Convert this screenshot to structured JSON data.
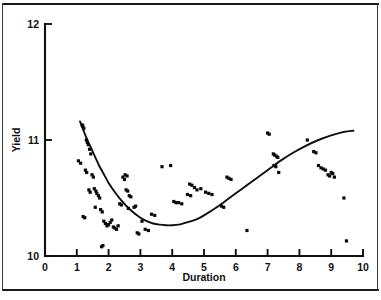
{
  "figure": {
    "background_color": "#ffffff",
    "ink_color": "#0d0d0d",
    "frame": {
      "top_rule": true,
      "bottom_rule": true,
      "left_rule": true,
      "right_rule": true
    }
  },
  "chart_data": {
    "type": "scatter",
    "title": "",
    "xlabel": "Duration",
    "ylabel": "Yield",
    "xlim": [
      0,
      10
    ],
    "ylim": [
      10,
      12
    ],
    "xticks": [
      0,
      1,
      2,
      3,
      4,
      5,
      6,
      7,
      8,
      9,
      10
    ],
    "xticklabels": [
      "0",
      "1",
      "2",
      "3",
      "4",
      "5",
      "6",
      "7",
      "8",
      "9",
      "10"
    ],
    "yticks": [
      10,
      11,
      12
    ],
    "yticklabels": [
      "10",
      "11",
      "12"
    ],
    "grid": false,
    "legend": null,
    "marker": "square",
    "marker_color": "#0a0a0a",
    "series": [
      {
        "name": "observations",
        "x": [
          1.17,
          1.19,
          1.22,
          1.05,
          1.12,
          1.3,
          1.33,
          1.36,
          1.4,
          1.44,
          1.27,
          1.31,
          1.48,
          1.52,
          1.38,
          1.42,
          1.55,
          1.6,
          1.63,
          1.68,
          1.72,
          1.2,
          1.25,
          1.58,
          1.75,
          1.8,
          1.85,
          1.9,
          1.95,
          2.0,
          2.05,
          2.1,
          2.15,
          2.2,
          2.25,
          2.3,
          1.78,
          1.82,
          2.35,
          2.4,
          2.45,
          2.5,
          2.55,
          2.6,
          2.65,
          2.7,
          2.8,
          2.9,
          2.95,
          3.05,
          3.15,
          3.25,
          3.35,
          3.45,
          2.52,
          2.58,
          2.85,
          2.62,
          4.05,
          4.12,
          4.2,
          4.3,
          3.95,
          4.55,
          4.62,
          4.7,
          4.48,
          4.58,
          4.78,
          4.9,
          5.05,
          5.15,
          5.25,
          5.55,
          5.62,
          5.72,
          5.78,
          5.85,
          3.68,
          6.35,
          7.0,
          7.05,
          7.18,
          7.22,
          7.28,
          7.32,
          7.2,
          7.26,
          7.35,
          8.25,
          8.45,
          8.52,
          8.6,
          8.68,
          8.75,
          8.82,
          8.9,
          8.95,
          9.0,
          9.05,
          9.1,
          9.4,
          9.48
        ],
        "y": [
          11.13,
          11.12,
          11.1,
          10.82,
          10.8,
          11.0,
          10.98,
          10.96,
          10.92,
          10.88,
          10.74,
          10.72,
          10.7,
          10.68,
          10.57,
          10.55,
          10.58,
          10.56,
          10.54,
          10.52,
          10.5,
          10.34,
          10.33,
          10.42,
          10.4,
          10.38,
          10.3,
          10.28,
          10.26,
          10.27,
          10.29,
          10.31,
          10.25,
          10.24,
          10.23,
          10.26,
          10.08,
          10.09,
          10.45,
          10.44,
          10.68,
          10.66,
          10.57,
          10.56,
          10.52,
          10.51,
          10.42,
          10.2,
          10.19,
          10.3,
          10.23,
          10.22,
          10.36,
          10.35,
          10.7,
          10.69,
          10.43,
          10.41,
          10.47,
          10.46,
          10.46,
          10.45,
          10.78,
          10.62,
          10.61,
          10.59,
          10.53,
          10.52,
          10.57,
          10.58,
          10.55,
          10.54,
          10.53,
          10.43,
          10.42,
          10.68,
          10.67,
          10.66,
          10.77,
          10.22,
          11.06,
          11.05,
          10.88,
          10.87,
          10.86,
          10.85,
          10.78,
          10.77,
          10.72,
          11.0,
          10.9,
          10.89,
          10.78,
          10.76,
          10.75,
          10.74,
          10.7,
          10.69,
          10.72,
          10.71,
          10.68,
          10.5,
          10.13
        ]
      }
    ],
    "fit_curve": {
      "name": "fitted quadratic trend",
      "x": [
        1.1,
        1.2,
        1.3,
        1.4,
        1.5,
        1.6,
        1.7,
        1.8,
        1.9,
        2.0,
        2.2,
        2.4,
        2.6,
        2.8,
        3.0,
        3.2,
        3.4,
        3.6,
        3.8,
        4.0,
        4.2,
        4.4,
        4.6,
        4.8,
        5.0,
        5.4,
        5.8,
        6.2,
        6.6,
        7.0,
        7.4,
        7.8,
        8.2,
        8.6,
        9.0,
        9.4,
        9.7
      ],
      "y": [
        11.16,
        11.09,
        11.02,
        10.96,
        10.9,
        10.84,
        10.78,
        10.73,
        10.68,
        10.63,
        10.55,
        10.48,
        10.42,
        10.37,
        10.33,
        10.3,
        10.28,
        10.27,
        10.265,
        10.265,
        10.27,
        10.285,
        10.3,
        10.32,
        10.35,
        10.42,
        10.5,
        10.58,
        10.66,
        10.74,
        10.82,
        10.89,
        10.95,
        11.0,
        11.04,
        11.07,
        11.08
      ]
    }
  }
}
